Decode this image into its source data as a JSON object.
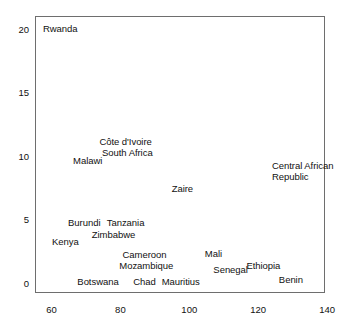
{
  "chart_data": {
    "type": "scatter",
    "title": "",
    "xlabel": "",
    "ylabel": "",
    "xlim": [
      55.2,
      139.4
    ],
    "ylim": [
      -0.8,
      21.0
    ],
    "xticks": [
      60,
      80,
      100,
      120,
      140
    ],
    "yticks": [
      0,
      5,
      10,
      15,
      20
    ],
    "grid": false,
    "legend": "none",
    "frame": "box",
    "labels_only": true,
    "points": [
      {
        "label": "Rwanda",
        "x": 57.5,
        "y": 20.0,
        "align": "left",
        "lines": [
          "Rwanda"
        ]
      },
      {
        "label": "Côte d'Ivoire",
        "x": 81.5,
        "y": 11.1,
        "align": "center",
        "lines": [
          "Côte d'Ivoire"
        ]
      },
      {
        "label": "South Africa",
        "x": 82.0,
        "y": 10.2,
        "align": "center",
        "lines": [
          "South Africa"
        ]
      },
      {
        "label": "Malawi",
        "x": 70.5,
        "y": 9.6,
        "align": "center",
        "lines": [
          "Malawi"
        ]
      },
      {
        "label": "Central African Republic",
        "x": 124.0,
        "y": 8.8,
        "align": "left",
        "lines": [
          "Central African",
          "Republic"
        ]
      },
      {
        "label": "Zaire",
        "x": 98.0,
        "y": 7.4,
        "align": "center",
        "lines": [
          "Zaire"
        ]
      },
      {
        "label": "Burundi",
        "x": 69.5,
        "y": 4.7,
        "align": "center",
        "lines": [
          "Burundi"
        ]
      },
      {
        "label": "Tanzania",
        "x": 81.5,
        "y": 4.7,
        "align": "center",
        "lines": [
          "Tanzania"
        ]
      },
      {
        "label": "Zimbabwe",
        "x": 78.0,
        "y": 3.8,
        "align": "center",
        "lines": [
          "Zimbabwe"
        ]
      },
      {
        "label": "Kenya",
        "x": 64.0,
        "y": 3.2,
        "align": "center",
        "lines": [
          "Kenya"
        ]
      },
      {
        "label": "Cameroon",
        "x": 87.0,
        "y": 2.2,
        "align": "center",
        "lines": [
          "Cameroon"
        ]
      },
      {
        "label": "Mali",
        "x": 107.0,
        "y": 2.3,
        "align": "center",
        "lines": [
          "Mali"
        ]
      },
      {
        "label": "Mozambique",
        "x": 87.5,
        "y": 1.3,
        "align": "center",
        "lines": [
          "Mozambique"
        ]
      },
      {
        "label": "Senegal",
        "x": 112.0,
        "y": 1.0,
        "align": "center",
        "lines": [
          "Senegal"
        ]
      },
      {
        "label": "Ethiopia",
        "x": 121.5,
        "y": 1.3,
        "align": "center",
        "lines": [
          "Ethiopia"
        ]
      },
      {
        "label": "Benin",
        "x": 129.5,
        "y": 0.2,
        "align": "center",
        "lines": [
          "Benin"
        ]
      },
      {
        "label": "Botswana",
        "x": 73.5,
        "y": 0.1,
        "align": "center",
        "lines": [
          "Botswana"
        ]
      },
      {
        "label": "Chad",
        "x": 87.0,
        "y": 0.1,
        "align": "center",
        "lines": [
          "Chad"
        ]
      },
      {
        "label": "Mauritius",
        "x": 97.5,
        "y": 0.1,
        "align": "center",
        "lines": [
          "Mauritius"
        ]
      }
    ]
  },
  "axes": {
    "x_tick_labels": [
      "60",
      "80",
      "100",
      "120",
      "140"
    ],
    "y_tick_labels": [
      "20",
      "15",
      "10",
      "5",
      "0"
    ]
  },
  "colors": {
    "frame": "#6e6e6e",
    "text": "#111111",
    "background": "#ffffff"
  }
}
